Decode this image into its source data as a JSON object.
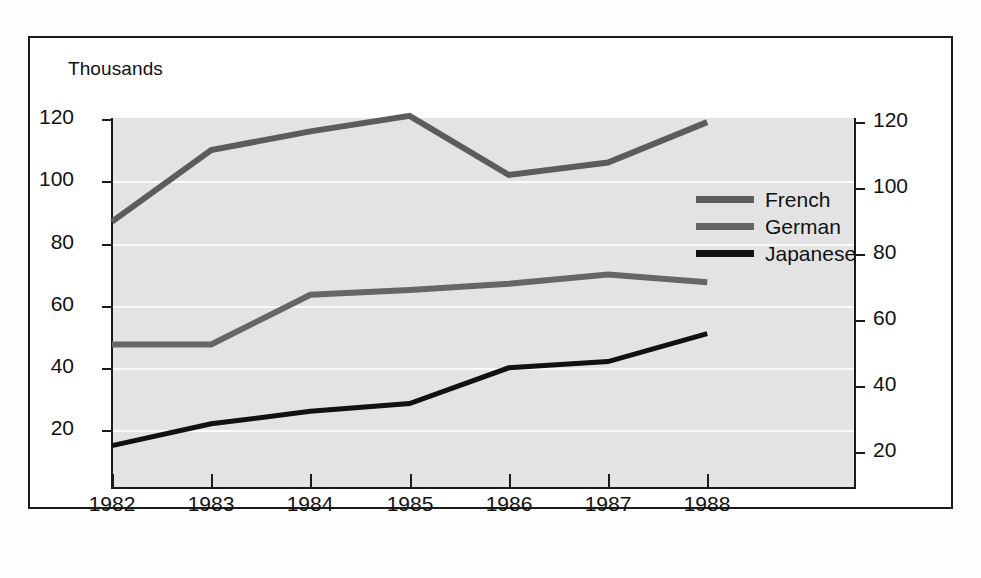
{
  "figure": {
    "unit_label": "Thousands",
    "background_color": "#e3e3e3",
    "gridline_color": "#fbfbfb",
    "axis_color": "#1b1b1b"
  },
  "legend": {
    "position": "inside-right",
    "entries": [
      {
        "label": "French",
        "color": "#5c5c5c"
      },
      {
        "label": "German",
        "color": "#666666"
      },
      {
        "label": "Japanese",
        "color": "#111111"
      }
    ]
  },
  "axes": {
    "y_left": {
      "ticks": [
        "120",
        "100",
        "80",
        "60",
        "40",
        "20"
      ]
    },
    "y_right": {
      "ticks": [
        "120",
        "100",
        "80",
        "60",
        "40",
        "20"
      ]
    },
    "x": {
      "ticks": [
        "1982",
        "1983",
        "1984",
        "1985",
        "1986",
        "1987",
        "1988"
      ]
    }
  },
  "chart_data": {
    "type": "line",
    "title": "",
    "subtitle": "",
    "xlabel": "",
    "ylabel": "Thousands",
    "x": [
      1982,
      1983,
      1984,
      1985,
      1986,
      1987,
      1988
    ],
    "categories": [
      "1982",
      "1983",
      "1984",
      "1985",
      "1986",
      "1987",
      "1988"
    ],
    "series": [
      {
        "name": "French",
        "color": "#5c5c5c",
        "values": [
          87,
          110,
          116,
          121,
          102,
          106,
          119
        ]
      },
      {
        "name": "German",
        "color": "#666666",
        "values": [
          47.5,
          47.5,
          63.5,
          65,
          67,
          70,
          67.5
        ]
      },
      {
        "name": "Japanese",
        "color": "#111111",
        "values": [
          15,
          22,
          26,
          28.5,
          40,
          42,
          51
        ]
      }
    ],
    "ylim": [
      0,
      130
    ],
    "ylim_right": [
      0,
      130
    ],
    "y_ticks": [
      20,
      40,
      60,
      80,
      100,
      120
    ],
    "y_ticks_right": [
      20,
      40,
      60,
      80,
      100,
      120
    ],
    "grid": true,
    "legend_position": "inside-right",
    "units": "Thousands"
  }
}
